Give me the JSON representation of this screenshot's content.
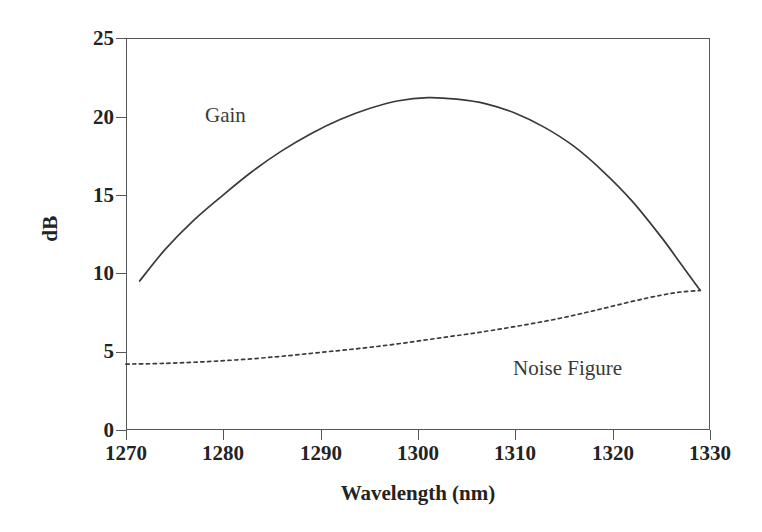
{
  "chart_data": {
    "type": "line",
    "title": "",
    "xlabel": "Wavelength (nm)",
    "ylabel": "dB",
    "xlim": [
      1270,
      1330
    ],
    "ylim": [
      0,
      25
    ],
    "xticks": [
      1270,
      1280,
      1290,
      1300,
      1310,
      1320,
      1330
    ],
    "yticks": [
      0,
      5,
      10,
      15,
      20,
      25
    ],
    "grid": false,
    "legend_position": "inline-annotations",
    "series": [
      {
        "name": "Gain",
        "style": "solid",
        "color": "#3a3a3a",
        "annotation": "Gain",
        "x": [
          1271.4,
          1274,
          1277,
          1280,
          1283,
          1286,
          1289,
          1292,
          1295,
          1298,
          1301,
          1304,
          1307,
          1310,
          1313,
          1316,
          1319,
          1322,
          1325,
          1327,
          1329
        ],
        "y": [
          9.5,
          11.5,
          13.4,
          15.0,
          16.5,
          17.8,
          18.9,
          19.8,
          20.5,
          21.0,
          21.2,
          21.1,
          20.8,
          20.2,
          19.3,
          18.1,
          16.5,
          14.6,
          12.3,
          10.6,
          8.9
        ]
      },
      {
        "name": "Noise Figure",
        "style": "dotted",
        "color": "#3a3a3a",
        "annotation": "Noise Figure",
        "x": [
          1270,
          1274,
          1278,
          1282,
          1286,
          1290,
          1294,
          1298,
          1302,
          1306,
          1310,
          1314,
          1318,
          1322,
          1325,
          1327,
          1329
        ],
        "y": [
          4.2,
          4.25,
          4.35,
          4.5,
          4.7,
          4.95,
          5.2,
          5.5,
          5.85,
          6.2,
          6.6,
          7.05,
          7.6,
          8.2,
          8.6,
          8.8,
          8.9
        ]
      }
    ]
  },
  "axes": {
    "y_tick_labels": [
      "25",
      "20",
      "15",
      "10",
      "5",
      "0"
    ],
    "x_tick_labels": [
      "1270",
      "1280",
      "1290",
      "1300",
      "1310",
      "1320",
      "1330"
    ],
    "y_title": "dB",
    "x_title": "Wavelength (nm)"
  },
  "annotations": {
    "gain": "Gain",
    "noise_figure": "Noise Figure"
  },
  "colors": {
    "axis": "#55555a",
    "text": "#232323",
    "curve": "#3a3a3a",
    "background": "#ffffff"
  }
}
